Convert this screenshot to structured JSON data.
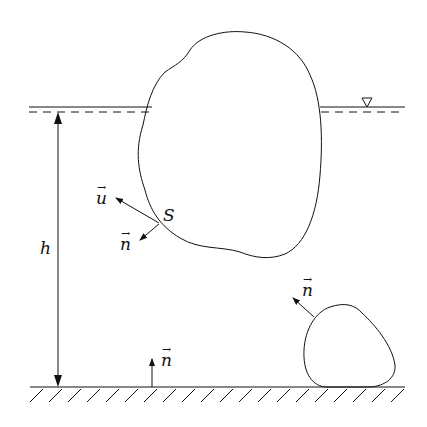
{
  "figure": {
    "labels": {
      "depth": "h",
      "surface": "S",
      "velocity": "u",
      "normal_surface": "n",
      "normal_rock": "n",
      "normal_bottom": "n",
      "vector_arrow": "→"
    },
    "symbols": {
      "free_surface_marker": "triangle-down"
    },
    "colors": {
      "stroke": "#111111",
      "background": "#ffffff"
    }
  }
}
